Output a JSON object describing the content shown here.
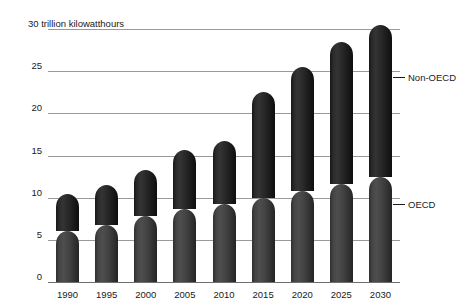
{
  "chart_data": {
    "type": "bar",
    "stacked": true,
    "title": "30 trillion kilowatthours",
    "xlabel": "",
    "ylabel": "trillion kilowatthours",
    "ylim": [
      0,
      30
    ],
    "yticks": [
      0,
      5,
      10,
      15,
      20,
      25,
      30
    ],
    "ytick_labels": [
      "0",
      "5",
      "10",
      "15",
      "20",
      "25",
      "30 trillion kilowatthours"
    ],
    "grid": true,
    "legend_position": "inline-callouts",
    "categories": [
      "1990",
      "1995",
      "2000",
      "2005",
      "2010",
      "2015",
      "2020",
      "2025",
      "2030"
    ],
    "series": [
      {
        "name": "OECD",
        "color": "#434343",
        "values": [
          6.0,
          6.8,
          7.8,
          8.6,
          9.3,
          10.0,
          10.8,
          11.6,
          12.5
        ]
      },
      {
        "name": "Non-OECD",
        "color": "#1f1f1f",
        "values": [
          4.4,
          4.7,
          5.5,
          7.1,
          7.4,
          12.5,
          14.7,
          16.9,
          18.0
        ]
      }
    ],
    "totals": [
      10.4,
      11.5,
      13.3,
      15.7,
      16.7,
      22.5,
      25.5,
      28.5,
      30.5
    ],
    "annotations": [
      {
        "label": "Non-OECD",
        "target_year": "2030",
        "value": 26.0
      },
      {
        "label": "OECD",
        "target_year": "2030",
        "value": 11.0
      }
    ]
  },
  "axis": {
    "y_title": "30 trillion kilowatthours"
  }
}
